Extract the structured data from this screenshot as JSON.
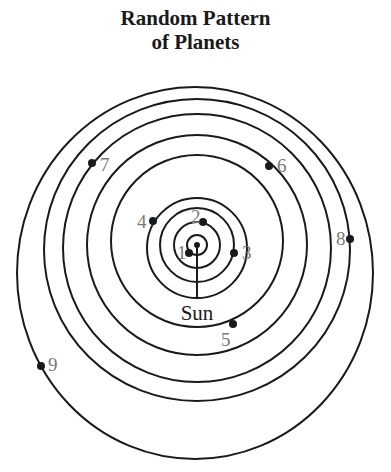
{
  "title": {
    "line1": "Random Pattern",
    "line2": "of Planets"
  },
  "sun": {
    "label": "Sun",
    "x": 197,
    "y": 245
  },
  "colors": {
    "line": "#1a1a1a",
    "planet_label": "#7a7a7a"
  },
  "planets": [
    {
      "label": "1",
      "x": 189,
      "y": 253
    },
    {
      "label": "2",
      "x": 203,
      "y": 222
    },
    {
      "label": "3",
      "x": 234,
      "y": 253
    },
    {
      "label": "4",
      "x": 153,
      "y": 221
    },
    {
      "label": "5",
      "x": 233,
      "y": 324
    },
    {
      "label": "6",
      "x": 269,
      "y": 166
    },
    {
      "label": "7",
      "x": 92,
      "y": 163
    },
    {
      "label": "8",
      "x": 350,
      "y": 239
    },
    {
      "label": "9",
      "x": 41,
      "y": 366
    }
  ]
}
